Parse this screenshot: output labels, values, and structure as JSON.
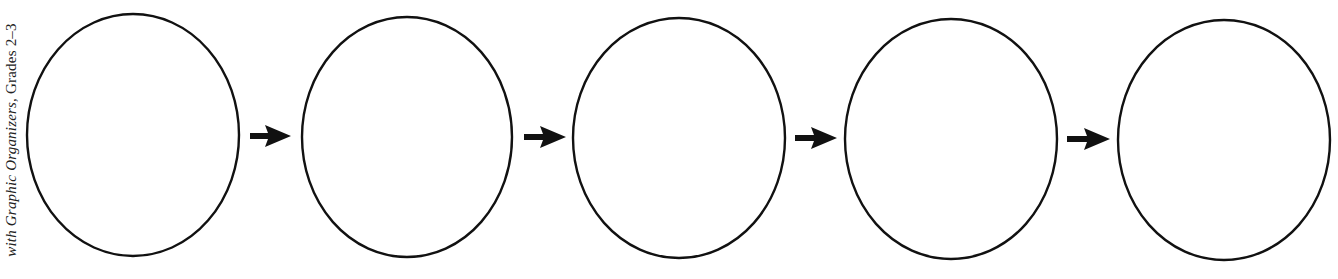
{
  "side_caption": {
    "text_italic": "with Graphic Organizers,",
    "text_plain": " Grades 2–3",
    "orientation": "rotated-90-bottom-to-top"
  },
  "diagram": {
    "type": "sequence-chain",
    "colors": {
      "stroke": "#111111",
      "background": "#ffffff"
    },
    "nodes": [
      {
        "id": "node-1",
        "shape": "ellipse",
        "cx": 133,
        "cy": 135,
        "rx": 106,
        "ry": 121,
        "label": ""
      },
      {
        "id": "node-2",
        "shape": "ellipse",
        "cx": 407,
        "cy": 137,
        "rx": 105,
        "ry": 120,
        "label": ""
      },
      {
        "id": "node-3",
        "shape": "ellipse",
        "cx": 679,
        "cy": 138,
        "rx": 106,
        "ry": 120,
        "label": ""
      },
      {
        "id": "node-4",
        "shape": "ellipse",
        "cx": 951,
        "cy": 139,
        "rx": 106,
        "ry": 120,
        "label": ""
      },
      {
        "id": "node-5",
        "shape": "ellipse",
        "cx": 1224,
        "cy": 140,
        "rx": 106,
        "ry": 120,
        "label": ""
      }
    ],
    "edges": [
      {
        "from": "node-1",
        "to": "node-2",
        "x1": 250,
        "x2": 291,
        "y": 136
      },
      {
        "from": "node-2",
        "to": "node-3",
        "x1": 524,
        "x2": 566,
        "y": 137
      },
      {
        "from": "node-3",
        "to": "node-4",
        "x1": 795,
        "x2": 837,
        "y": 138
      },
      {
        "from": "node-4",
        "to": "node-5",
        "x1": 1067,
        "x2": 1110,
        "y": 139
      }
    ]
  }
}
